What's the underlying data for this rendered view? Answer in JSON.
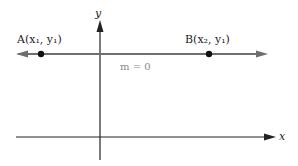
{
  "diagram": {
    "axes": {
      "x_label": "x",
      "y_label": "y"
    },
    "line": {
      "slope_label": "m = 0",
      "color": "#6e6e6e"
    },
    "points": [
      {
        "name": "A",
        "label": "A(x₁, y₁)"
      },
      {
        "name": "B",
        "label": "B(x₂, y₁)"
      }
    ]
  }
}
